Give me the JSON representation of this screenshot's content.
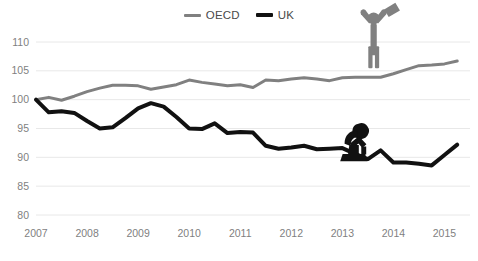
{
  "chart_data": {
    "type": "line",
    "title": "",
    "subtitle": "",
    "xlabel": "",
    "ylabel": "",
    "ylim": [
      80,
      110
    ],
    "yticks": [
      80,
      85,
      90,
      95,
      100,
      105,
      110
    ],
    "ytick_labels": [
      "80",
      "85",
      "90",
      "95",
      "100",
      "105",
      "110"
    ],
    "xlim": [
      2007,
      2015.5
    ],
    "xticks": [
      2007,
      2008,
      2009,
      2010,
      2011,
      2012,
      2013,
      2014,
      2015
    ],
    "xtick_labels": [
      "2007",
      "2008",
      "2009",
      "2010",
      "2011",
      "2012",
      "2013",
      "2014",
      "2015"
    ],
    "grid": true,
    "grid_axis": "y",
    "legend_position": "top-center",
    "x": [
      2007.0,
      2007.25,
      2007.5,
      2007.75,
      2008.0,
      2008.25,
      2008.5,
      2008.75,
      2009.0,
      2009.25,
      2009.5,
      2009.75,
      2010.0,
      2010.25,
      2010.5,
      2010.75,
      2011.0,
      2011.25,
      2011.5,
      2011.75,
      2012.0,
      2012.25,
      2012.5,
      2012.75,
      2013.0,
      2013.25,
      2013.5,
      2013.75,
      2014.0,
      2014.25,
      2014.5,
      2014.75,
      2015.0,
      2015.25
    ],
    "series": [
      {
        "name": "OECD",
        "color": "#808080",
        "line_width": 3,
        "values": [
          100.0,
          100.4,
          99.9,
          100.6,
          101.4,
          102.0,
          102.5,
          102.5,
          102.4,
          101.8,
          102.2,
          102.6,
          103.4,
          103.0,
          102.7,
          102.4,
          102.6,
          102.1,
          103.4,
          103.3,
          103.6,
          103.8,
          103.6,
          103.3,
          103.8,
          103.9,
          103.9,
          103.9,
          104.5,
          105.2,
          105.9,
          106.0,
          106.2,
          106.7
        ]
      },
      {
        "name": "UK",
        "color": "#111111",
        "line_width": 4,
        "values": [
          100.0,
          97.8,
          98.0,
          97.7,
          96.3,
          95.0,
          95.2,
          96.8,
          98.5,
          99.4,
          98.8,
          97.0,
          95.0,
          94.9,
          95.9,
          94.2,
          94.4,
          94.3,
          92.0,
          91.5,
          91.7,
          92.0,
          91.4,
          91.5,
          91.6,
          90.6,
          89.7,
          91.2,
          89.1,
          89.1,
          88.9,
          88.6,
          90.4,
          92.2
        ]
      }
    ],
    "annotations": [
      {
        "name": "celebrating-figure",
        "depicts": "person with arms raised holding a flag",
        "color": "#808080",
        "associated_series": "OECD"
      },
      {
        "name": "despairing-figure",
        "depicts": "person sitting head in hands",
        "color": "#111111",
        "associated_series": "UK"
      }
    ]
  },
  "legend": {
    "entries": [
      {
        "label": "OECD",
        "color": "#808080"
      },
      {
        "label": "UK",
        "color": "#111111"
      }
    ]
  },
  "colors": {
    "oecd_line": "#808080",
    "uk_line": "#111111",
    "gridline": "#e8e8e8",
    "tick_text": "#7f7f7f",
    "background": "#ffffff"
  }
}
